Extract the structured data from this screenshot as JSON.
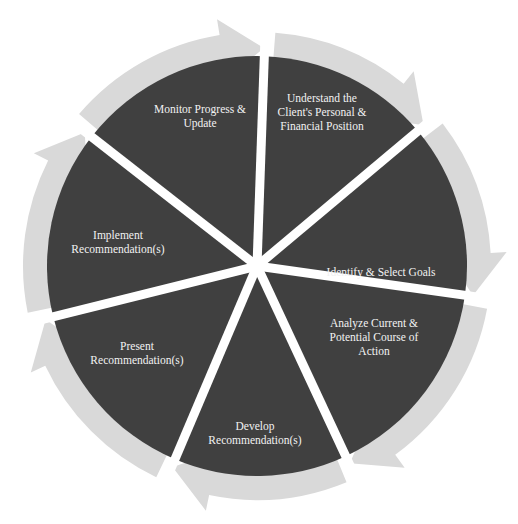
{
  "diagram": {
    "type": "cycle",
    "colors": {
      "segment": "#404040",
      "arrow": "#d9d9d9",
      "label": "#f2f2f2",
      "background": "#ffffff"
    },
    "steps": [
      {
        "id": "understand",
        "lines": [
          "Understand the",
          "Client's Personal &",
          "Financial Position"
        ]
      },
      {
        "id": "identify",
        "lines": [
          "Identify & Select Goals"
        ]
      },
      {
        "id": "analyze",
        "lines": [
          "Analyze Current &",
          "Potential Course of",
          "Action"
        ]
      },
      {
        "id": "develop",
        "lines": [
          "Develop",
          "Recommendation(s)"
        ]
      },
      {
        "id": "present",
        "lines": [
          "Present",
          "Recommendation(s)"
        ]
      },
      {
        "id": "implement",
        "lines": [
          "Implement",
          "Recommendation(s)"
        ]
      },
      {
        "id": "monitor",
        "lines": [
          "Monitor Progress &",
          "Update"
        ]
      }
    ]
  }
}
